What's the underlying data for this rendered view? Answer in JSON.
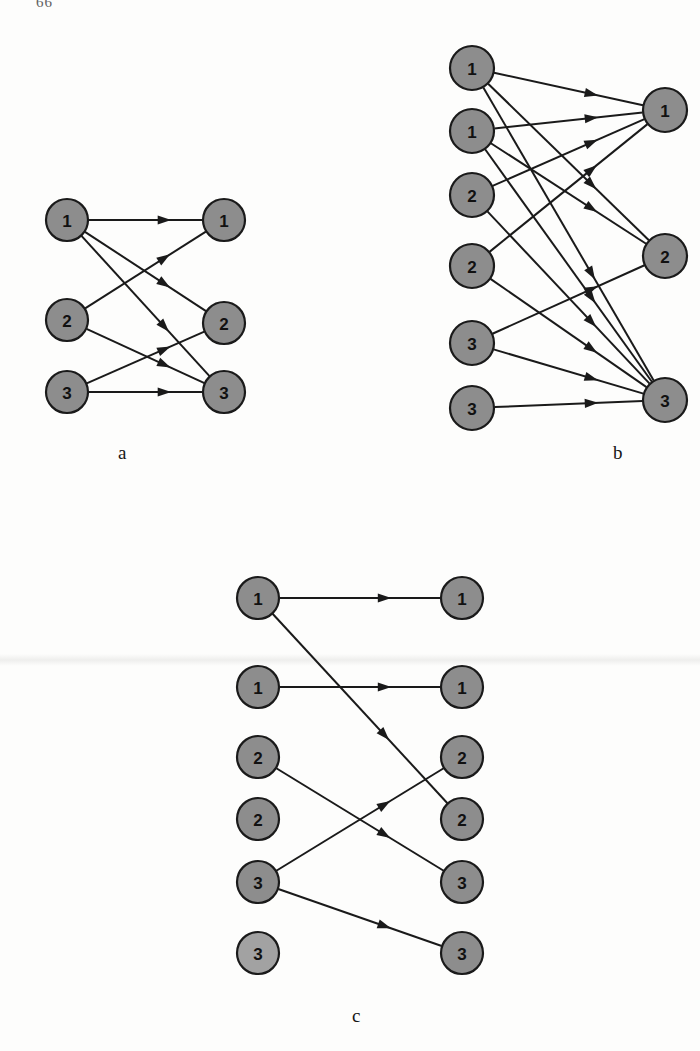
{
  "page": {
    "corner_mark": "66",
    "background_color": "#fdfdfc",
    "node_fill": "#8d8d8d",
    "node_fill_light": "#a2a2a2",
    "node_stroke": "#1a1a1a",
    "edge_color": "#1a1a1a",
    "label_color": "#111111"
  },
  "chart_data": {
    "type": "diagram",
    "diagram_kind": "bipartite-directed-graph",
    "title": "",
    "panels": [
      {
        "id": "a",
        "caption": "a",
        "caption_x": 118,
        "caption_y": 442,
        "left_nodes": [
          {
            "id": "aL0",
            "label": "1",
            "x": 67,
            "y": 220,
            "r": 21
          },
          {
            "id": "aL1",
            "label": "2",
            "x": 67,
            "y": 320,
            "r": 21
          },
          {
            "id": "aL2",
            "label": "3",
            "x": 67,
            "y": 392,
            "r": 21
          }
        ],
        "right_nodes": [
          {
            "id": "aR0",
            "label": "1",
            "x": 224,
            "y": 220,
            "r": 21
          },
          {
            "id": "aR1",
            "label": "2",
            "x": 224,
            "y": 323,
            "r": 21
          },
          {
            "id": "aR2",
            "label": "3",
            "x": 224,
            "y": 392,
            "r": 21
          }
        ],
        "edges": [
          {
            "from": "aL0",
            "to": "aR0"
          },
          {
            "from": "aL0",
            "to": "aR1"
          },
          {
            "from": "aL0",
            "to": "aR2"
          },
          {
            "from": "aL1",
            "to": "aR0"
          },
          {
            "from": "aL1",
            "to": "aR2"
          },
          {
            "from": "aL2",
            "to": "aR1"
          },
          {
            "from": "aL2",
            "to": "aR2"
          }
        ]
      },
      {
        "id": "b",
        "caption": "b",
        "caption_x": 613,
        "caption_y": 442,
        "left_nodes": [
          {
            "id": "bL0",
            "label": "1",
            "x": 472,
            "y": 68,
            "r": 22
          },
          {
            "id": "bL1",
            "label": "1",
            "x": 472,
            "y": 131,
            "r": 22
          },
          {
            "id": "bL2",
            "label": "2",
            "x": 472,
            "y": 195,
            "r": 22
          },
          {
            "id": "bL3",
            "label": "2",
            "x": 472,
            "y": 266,
            "r": 22
          },
          {
            "id": "bL4",
            "label": "3",
            "x": 472,
            "y": 343,
            "r": 22
          },
          {
            "id": "bL5",
            "label": "3",
            "x": 472,
            "y": 408,
            "r": 22
          }
        ],
        "right_nodes": [
          {
            "id": "bR0",
            "label": "1",
            "x": 665,
            "y": 110,
            "r": 22
          },
          {
            "id": "bR1",
            "label": "2",
            "x": 665,
            "y": 256,
            "r": 22
          },
          {
            "id": "bR2",
            "label": "3",
            "x": 665,
            "y": 400,
            "r": 22
          }
        ],
        "edges": [
          {
            "from": "bL0",
            "to": "bR0"
          },
          {
            "from": "bL0",
            "to": "bR1"
          },
          {
            "from": "bL0",
            "to": "bR2"
          },
          {
            "from": "bL1",
            "to": "bR0"
          },
          {
            "from": "bL1",
            "to": "bR1"
          },
          {
            "from": "bL1",
            "to": "bR2"
          },
          {
            "from": "bL2",
            "to": "bR0"
          },
          {
            "from": "bL2",
            "to": "bR2"
          },
          {
            "from": "bL3",
            "to": "bR0"
          },
          {
            "from": "bL3",
            "to": "bR2"
          },
          {
            "from": "bL4",
            "to": "bR1"
          },
          {
            "from": "bL4",
            "to": "bR2"
          },
          {
            "from": "bL5",
            "to": "bR2"
          }
        ]
      },
      {
        "id": "c",
        "caption": "c",
        "caption_x": 352,
        "caption_y": 1005,
        "left_nodes": [
          {
            "id": "cL0",
            "label": "1",
            "x": 258,
            "y": 598,
            "r": 21
          },
          {
            "id": "cL1",
            "label": "1",
            "x": 258,
            "y": 687,
            "r": 21
          },
          {
            "id": "cL2",
            "label": "2",
            "x": 258,
            "y": 757,
            "r": 21
          },
          {
            "id": "cL3",
            "label": "2",
            "x": 258,
            "y": 819,
            "r": 21
          },
          {
            "id": "cL4",
            "label": "3",
            "x": 258,
            "y": 882,
            "r": 21
          },
          {
            "id": "cL5",
            "label": "3",
            "x": 258,
            "y": 953,
            "r": 21
          }
        ],
        "right_nodes": [
          {
            "id": "cR0",
            "label": "1",
            "x": 462,
            "y": 598,
            "r": 21
          },
          {
            "id": "cR1",
            "label": "1",
            "x": 462,
            "y": 687,
            "r": 21
          },
          {
            "id": "cR2",
            "label": "2",
            "x": 462,
            "y": 757,
            "r": 21
          },
          {
            "id": "cR3",
            "label": "2",
            "x": 462,
            "y": 819,
            "r": 21
          },
          {
            "id": "cR4",
            "label": "3",
            "x": 462,
            "y": 882,
            "r": 21
          },
          {
            "id": "cR5",
            "label": "3",
            "x": 462,
            "y": 953,
            "r": 21
          }
        ],
        "edges": [
          {
            "from": "cL0",
            "to": "cR0"
          },
          {
            "from": "cL0",
            "to": "cR3"
          },
          {
            "from": "cL1",
            "to": "cR1"
          },
          {
            "from": "cL2",
            "to": "cR4"
          },
          {
            "from": "cL4",
            "to": "cR2"
          },
          {
            "from": "cL4",
            "to": "cR5"
          }
        ]
      }
    ]
  }
}
